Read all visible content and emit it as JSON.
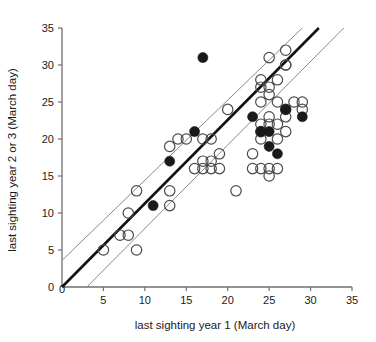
{
  "chart_data": {
    "type": "scatter",
    "title": "",
    "xlabel": "last sighting year 1 (March day)",
    "ylabel": "last sighting year 2 or 3 (March day)",
    "xlim": [
      0,
      35
    ],
    "ylim": [
      0,
      35
    ],
    "xticks": [
      0,
      5,
      10,
      15,
      20,
      25,
      30,
      35
    ],
    "yticks": [
      0,
      5,
      10,
      15,
      20,
      25,
      30,
      35
    ],
    "xtick_labels": [
      "0",
      "5",
      "10",
      "15",
      "20",
      "25",
      "30",
      "35"
    ],
    "ytick_labels": [
      "0",
      "5",
      "10",
      "15",
      "20",
      "25",
      "30",
      "35"
    ],
    "grid": false,
    "legend": false,
    "series": [
      {
        "name": "open-circles",
        "marker": "open circle",
        "color": "#4a4a4a",
        "points": [
          [
            5,
            5
          ],
          [
            7,
            7
          ],
          [
            8,
            7
          ],
          [
            9,
            5
          ],
          [
            8,
            10
          ],
          [
            9,
            13
          ],
          [
            13,
            13
          ],
          [
            13,
            11
          ],
          [
            13,
            19
          ],
          [
            14,
            20
          ],
          [
            15,
            20
          ],
          [
            16,
            16
          ],
          [
            17,
            16
          ],
          [
            17,
            20
          ],
          [
            17,
            17
          ],
          [
            18,
            20
          ],
          [
            18,
            16
          ],
          [
            18,
            17
          ],
          [
            19,
            16
          ],
          [
            19,
            18
          ],
          [
            20,
            24
          ],
          [
            21,
            13
          ],
          [
            23,
            18
          ],
          [
            23,
            16
          ],
          [
            24,
            16
          ],
          [
            24,
            20
          ],
          [
            24,
            25
          ],
          [
            24,
            27
          ],
          [
            24,
            28
          ],
          [
            24,
            22
          ],
          [
            24,
            21
          ],
          [
            25,
            16
          ],
          [
            25,
            15
          ],
          [
            25,
            26
          ],
          [
            25,
            27
          ],
          [
            25,
            31
          ],
          [
            25,
            23
          ],
          [
            25,
            22
          ],
          [
            26,
            25
          ],
          [
            26,
            28
          ],
          [
            26,
            22
          ],
          [
            26,
            20
          ],
          [
            26,
            16
          ],
          [
            27,
            30
          ],
          [
            27,
            32
          ],
          [
            27,
            30
          ],
          [
            27,
            24
          ],
          [
            27,
            23
          ],
          [
            27,
            21
          ],
          [
            28,
            25
          ],
          [
            29,
            25
          ],
          [
            29,
            24
          ]
        ]
      },
      {
        "name": "filled-circles",
        "marker": "filled circle",
        "color": "#1a1a1a",
        "points": [
          [
            11,
            11
          ],
          [
            13,
            17
          ],
          [
            16,
            21
          ],
          [
            17,
            31
          ],
          [
            23,
            23
          ],
          [
            24,
            21
          ],
          [
            25,
            21
          ],
          [
            25,
            19
          ],
          [
            26,
            18
          ],
          [
            27,
            24
          ],
          [
            29,
            23
          ]
        ]
      }
    ],
    "lines": [
      {
        "name": "fit-line",
        "style": "thick solid",
        "from": [
          0,
          0
        ],
        "to": [
          31,
          35
        ],
        "color": "#111111"
      },
      {
        "name": "upper-confidence-line",
        "style": "thin solid",
        "from": [
          0,
          3.6
        ],
        "to": [
          29,
          35
        ],
        "color": "#8a8a8a"
      },
      {
        "name": "lower-confidence-line",
        "style": "thin solid",
        "from": [
          3,
          0
        ],
        "to": [
          34,
          35
        ],
        "color": "#8a8a8a"
      }
    ]
  }
}
